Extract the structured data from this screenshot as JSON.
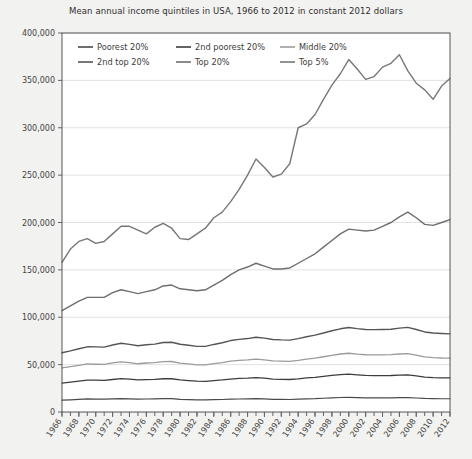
{
  "chart_data": {
    "type": "line",
    "title": "Mean annual income quintiles in USA, 1966 to 2012 in constant 2012 dollars",
    "xlabel": "",
    "ylabel": "",
    "xlim": [
      1966,
      2012
    ],
    "ylim": [
      0,
      400000
    ],
    "ytick_labels": [
      "0",
      "50,000",
      "100,000",
      "150,000",
      "200,000",
      "250,000",
      "300,000",
      "350,000",
      "400,000"
    ],
    "ytick_values": [
      0,
      50000,
      100000,
      150000,
      200000,
      250000,
      300000,
      350000,
      400000
    ],
    "xtick_labels": [
      "1966",
      "1968",
      "1970",
      "1972",
      "1974",
      "1976",
      "1978",
      "1980",
      "1982",
      "1984",
      "1986",
      "1988",
      "1990",
      "1992",
      "1994",
      "1996",
      "1998",
      "2000",
      "2002",
      "2004",
      "2006",
      "2008",
      "2010",
      "2012"
    ],
    "xtick_values": [
      1966,
      1968,
      1970,
      1972,
      1974,
      1976,
      1978,
      1980,
      1982,
      1984,
      1986,
      1988,
      1990,
      1992,
      1994,
      1996,
      1998,
      2000,
      2002,
      2004,
      2006,
      2008,
      2010,
      2012
    ],
    "grid": "horizontal",
    "legend_position": "top-left-inside",
    "x": [
      1966,
      1967,
      1968,
      1969,
      1970,
      1971,
      1972,
      1973,
      1974,
      1975,
      1976,
      1977,
      1978,
      1979,
      1980,
      1981,
      1982,
      1983,
      1984,
      1985,
      1986,
      1987,
      1988,
      1989,
      1990,
      1991,
      1992,
      1993,
      1994,
      1995,
      1996,
      1997,
      1998,
      1999,
      2000,
      2001,
      2002,
      2003,
      2004,
      2005,
      2006,
      2007,
      2008,
      2009,
      2010,
      2011,
      2012
    ],
    "series": [
      {
        "name": "Poorest 20%",
        "color": "#4a4a4a",
        "width": 1.2,
        "values": [
          12500,
          12900,
          13400,
          13800,
          13600,
          13500,
          13900,
          14200,
          13900,
          13500,
          13700,
          13800,
          14100,
          14100,
          13400,
          13100,
          12800,
          12700,
          13000,
          13200,
          13500,
          13700,
          13900,
          14200,
          13900,
          13400,
          13300,
          13200,
          13500,
          13900,
          14100,
          14500,
          14900,
          15300,
          15500,
          15200,
          15000,
          14900,
          15000,
          15000,
          15100,
          15200,
          14800,
          14300,
          14100,
          14000,
          14000
        ]
      },
      {
        "name": "2nd poorest 20%",
        "color": "#3d3d3d",
        "width": 1.3,
        "values": [
          30500,
          31500,
          32600,
          33700,
          33600,
          33400,
          34300,
          35200,
          34600,
          33800,
          34200,
          34400,
          35100,
          35100,
          33900,
          33200,
          32500,
          32400,
          33200,
          33900,
          34800,
          35400,
          35700,
          36300,
          35700,
          34800,
          34500,
          34300,
          35000,
          36000,
          36600,
          37600,
          38600,
          39400,
          39900,
          39200,
          38600,
          38400,
          38400,
          38500,
          38900,
          39200,
          38100,
          36900,
          36300,
          36000,
          36000
        ]
      },
      {
        "name": "Middle 20%",
        "color": "#9b9b9b",
        "width": 1.3,
        "values": [
          46500,
          47800,
          49300,
          50700,
          50400,
          50200,
          51800,
          53000,
          52100,
          50900,
          51700,
          52100,
          53200,
          53300,
          51600,
          50700,
          49800,
          49700,
          51000,
          52200,
          53700,
          54500,
          55000,
          55900,
          55100,
          53900,
          53600,
          53400,
          54400,
          55700,
          56800,
          58300,
          59800,
          61200,
          62000,
          61100,
          60400,
          60200,
          60300,
          60500,
          61200,
          61700,
          60100,
          58200,
          57400,
          57000,
          56800
        ]
      },
      {
        "name": "2nd top 20%",
        "color": "#555555",
        "width": 1.4,
        "values": [
          62500,
          64500,
          66700,
          68800,
          68700,
          68500,
          70700,
          72500,
          71400,
          69900,
          71000,
          71600,
          73300,
          73600,
          71500,
          70400,
          69300,
          69300,
          71300,
          73100,
          75400,
          76700,
          77500,
          78900,
          78000,
          76500,
          76100,
          75900,
          77500,
          79400,
          81100,
          83400,
          85700,
          87800,
          89200,
          88000,
          87100,
          86900,
          87100,
          87400,
          88500,
          89300,
          87100,
          84500,
          83400,
          82900,
          82500
        ]
      },
      {
        "name": "Top 20%",
        "color": "#6e6e6e",
        "width": 1.4,
        "values": [
          107000,
          112000,
          117000,
          121000,
          121000,
          121000,
          126000,
          129000,
          127000,
          125000,
          127000,
          129000,
          133000,
          134000,
          130000,
          129000,
          128000,
          129000,
          134000,
          139000,
          145000,
          150000,
          153000,
          157000,
          154000,
          151000,
          151000,
          152000,
          157000,
          162000,
          167000,
          174000,
          181000,
          188000,
          193000,
          192000,
          191000,
          192000,
          196000,
          200000,
          206000,
          211000,
          205000,
          198000,
          197000,
          200000,
          203000
        ]
      },
      {
        "name": "Top 5%",
        "color": "#777777",
        "width": 1.4,
        "values": [
          158000,
          172000,
          180000,
          183000,
          178000,
          180000,
          188000,
          196000,
          196000,
          192000,
          188000,
          195000,
          199000,
          194000,
          183000,
          182000,
          188000,
          194000,
          205000,
          211000,
          222000,
          235000,
          250000,
          267000,
          258000,
          248000,
          251000,
          262000,
          300000,
          304000,
          314000,
          330000,
          345000,
          357000,
          372000,
          362000,
          351000,
          354000,
          364000,
          368000,
          377000,
          360000,
          347000,
          340000,
          330000,
          344000,
          352000
        ]
      }
    ],
    "legend_rows": [
      [
        "Poorest 20%",
        "2nd poorest 20%",
        "Middle 20%"
      ],
      [
        "2nd top 20%",
        "Top 20%",
        "Top 5%"
      ]
    ]
  },
  "figure": {
    "background_color": "#f2f2f0",
    "plot_background_color": "#ffffff",
    "axis_color": "#555555",
    "grid_color": "#e2e2e0"
  }
}
